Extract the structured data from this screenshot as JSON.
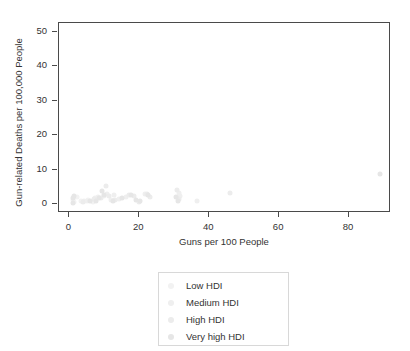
{
  "chart_data": {
    "type": "scatter",
    "title": "",
    "xlabel": "Guns per 100 People",
    "ylabel": "Gun-related Deaths per 100,000 People",
    "xlim": [
      -3,
      92
    ],
    "ylim": [
      -2.5,
      52.5
    ],
    "xticks": [
      0,
      20,
      40,
      60,
      80
    ],
    "yticks": [
      0,
      10,
      20,
      30,
      40,
      50
    ],
    "xtick_labels": [
      "0",
      "20",
      "40",
      "60",
      "80"
    ],
    "ytick_labels": [
      "0",
      "10",
      "20",
      "30",
      "40",
      "50"
    ],
    "grid": false,
    "legend_position": "below-center",
    "marker_size_px": 5,
    "series": [
      {
        "name": "Low HDI",
        "color": "#f2f2f2",
        "points": [
          {
            "x": 1.1,
            "y": 1.2
          },
          {
            "x": 1.4,
            "y": 0.6
          },
          {
            "x": 2.1,
            "y": 2.0
          },
          {
            "x": 3.2,
            "y": 0.9
          },
          {
            "x": 5.4,
            "y": 1.4
          },
          {
            "x": 6.6,
            "y": 0.7
          },
          {
            "x": 9.9,
            "y": 2.4
          }
        ]
      },
      {
        "name": "Medium HDI",
        "color": "#efefef",
        "points": [
          {
            "x": 4.1,
            "y": 1.0
          },
          {
            "x": 5.0,
            "y": 1.1
          },
          {
            "x": 7.3,
            "y": 1.8
          },
          {
            "x": 8.1,
            "y": 2.2
          },
          {
            "x": 10.7,
            "y": 3.1
          },
          {
            "x": 11.9,
            "y": 1.3
          },
          {
            "x": 12.8,
            "y": 2.6
          },
          {
            "x": 14.2,
            "y": 1.5
          },
          {
            "x": 16.1,
            "y": 2.1
          },
          {
            "x": 21.7,
            "y": 2.9
          },
          {
            "x": 31.2,
            "y": 3.4
          },
          {
            "x": 31.6,
            "y": 2.4
          },
          {
            "x": 36.4,
            "y": 0.9
          }
        ]
      },
      {
        "name": "High HDI",
        "color": "#ececec",
        "points": [
          {
            "x": 3.9,
            "y": 0.8
          },
          {
            "x": 6.9,
            "y": 1.6
          },
          {
            "x": 9.1,
            "y": 1.9
          },
          {
            "x": 10.4,
            "y": 5.4
          },
          {
            "x": 11.2,
            "y": 2.3
          },
          {
            "x": 13.1,
            "y": 1.2
          },
          {
            "x": 17.0,
            "y": 2.7
          },
          {
            "x": 18.4,
            "y": 2.5
          },
          {
            "x": 19.8,
            "y": 0.6
          },
          {
            "x": 22.3,
            "y": 3.0
          },
          {
            "x": 23.0,
            "y": 2.2
          },
          {
            "x": 30.9,
            "y": 4.3
          },
          {
            "x": 31.3,
            "y": 1.6
          },
          {
            "x": 46.0,
            "y": 3.2
          }
        ]
      },
      {
        "name": "Very high HDI",
        "color": "#e6e6e6",
        "points": [
          {
            "x": 0.9,
            "y": 0.3
          },
          {
            "x": 1.0,
            "y": 1.8
          },
          {
            "x": 1.2,
            "y": 2.5
          },
          {
            "x": 5.8,
            "y": 0.9
          },
          {
            "x": 7.6,
            "y": 1.1
          },
          {
            "x": 8.5,
            "y": 1.7
          },
          {
            "x": 9.3,
            "y": 3.9
          },
          {
            "x": 10.0,
            "y": 2.8
          },
          {
            "x": 12.4,
            "y": 1.0
          },
          {
            "x": 15.0,
            "y": 1.8
          },
          {
            "x": 17.6,
            "y": 2.8
          },
          {
            "x": 19.0,
            "y": 1.4
          },
          {
            "x": 20.1,
            "y": 1.0
          },
          {
            "x": 22.6,
            "y": 2.6
          },
          {
            "x": 30.6,
            "y": 2.1
          },
          {
            "x": 31.0,
            "y": 0.9
          },
          {
            "x": 88.8,
            "y": 8.7
          }
        ]
      }
    ]
  },
  "legend": {
    "items": [
      {
        "label": "Low HDI"
      },
      {
        "label": "Medium HDI"
      },
      {
        "label": "High HDI"
      },
      {
        "label": "Very high HDI"
      }
    ]
  }
}
